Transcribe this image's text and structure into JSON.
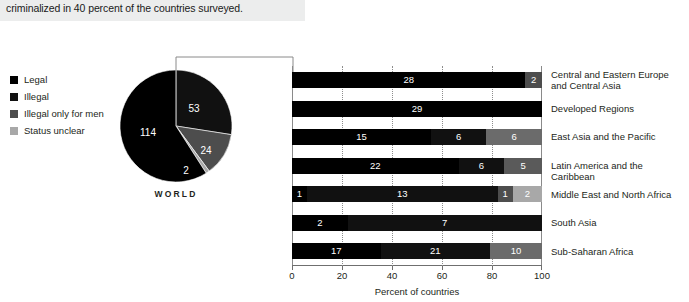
{
  "caption": {
    "text": "criminalized in 40 percent of the countries surveyed."
  },
  "legend": {
    "items": [
      {
        "label": "Legal",
        "color": "#000000"
      },
      {
        "label": "Illegal",
        "color": "#111111"
      },
      {
        "label": "Illegal only for men",
        "color": "#4d4d4d"
      },
      {
        "label": "Status unclear",
        "color": "#a8a8a8"
      }
    ]
  },
  "pie": {
    "title": "WORLD",
    "values": [
      114,
      53,
      24,
      2
    ],
    "labels": [
      "Legal",
      "Illegal",
      "Illegal only for men",
      "Status unclear"
    ]
  },
  "axis": {
    "ticks": [
      "0",
      "20",
      "40",
      "60",
      "80",
      "100"
    ],
    "title": "Percent of countries"
  },
  "chart_data": {
    "type": "bar",
    "title": "",
    "subtitle": "",
    "xlabel": "Percent of countries",
    "ylabel": "",
    "xlim": [
      0,
      100
    ],
    "grid": true,
    "stacked": true,
    "normalized": true,
    "orientation": "horizontal",
    "legend_position": "left",
    "categories": [
      "Central and Eastern Europe\nand Central Asia",
      "Developed Regions",
      "East Asia and the Pacific",
      "Latin America and the Caribbean",
      "Middle East and North Africa",
      "South Asia",
      "Sub-Saharan Africa"
    ],
    "series": [
      {
        "name": "Legal",
        "color": "#000000",
        "values": [
          28,
          29,
          15,
          22,
          1,
          2,
          17
        ]
      },
      {
        "name": "Illegal",
        "color": "#111111",
        "values": [
          0,
          0,
          6,
          6,
          13,
          7,
          21
        ]
      },
      {
        "name": "Illegal only for men",
        "color": "#4d4d4d",
        "values": [
          2,
          0,
          0,
          0,
          1,
          0,
          0
        ]
      },
      {
        "name": "Status unclear",
        "color": "#a8a8a8",
        "values": [
          0,
          0,
          6,
          5,
          2,
          0,
          10
        ]
      }
    ],
    "bar_labels": [
      [
        {
          "v": "28",
          "color": "#000000"
        },
        {
          "v": "2",
          "color": "#4d4d4d"
        }
      ],
      [
        {
          "v": "29",
          "color": "#000000"
        }
      ],
      [
        {
          "v": "15",
          "color": "#000000"
        },
        {
          "v": "6",
          "color": "#111111"
        },
        {
          "v": "6",
          "color": "#6b6b6b"
        }
      ],
      [
        {
          "v": "22",
          "color": "#000000"
        },
        {
          "v": "6",
          "color": "#111111"
        },
        {
          "v": "5",
          "color": "#5a5a5a"
        }
      ],
      [
        {
          "v": "1",
          "color": "#000000"
        },
        {
          "v": "13",
          "color": "#111111"
        },
        {
          "v": "1",
          "color": "#4d4d4d"
        },
        {
          "v": "2",
          "color": "#a8a8a8"
        }
      ],
      [
        {
          "v": "2",
          "color": "#000000"
        },
        {
          "v": "7",
          "color": "#111111"
        }
      ],
      [
        {
          "v": "17",
          "color": "#000000"
        },
        {
          "v": "21",
          "color": "#111111"
        },
        {
          "v": "10",
          "color": "#6b6b6b"
        }
      ]
    ]
  }
}
